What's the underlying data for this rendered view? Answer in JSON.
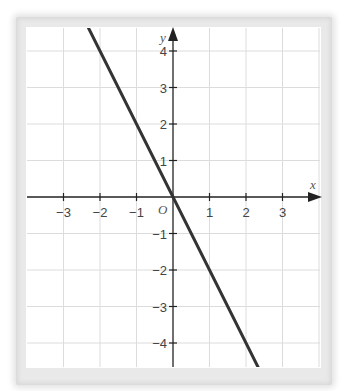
{
  "chart_data": {
    "type": "line",
    "title": "",
    "xlabel": "x",
    "ylabel": "y",
    "origin_label": "O",
    "xlim": [
      -4,
      4
    ],
    "ylim": [
      -5,
      5
    ],
    "x_ticks": [
      -3,
      -2,
      -1,
      1,
      2,
      3
    ],
    "y_ticks": [
      -4,
      -3,
      -2,
      -1,
      1,
      2,
      3,
      4
    ],
    "x_tick_labels": [
      "−3",
      "−2",
      "−1",
      "1",
      "2",
      "3"
    ],
    "y_tick_labels": [
      "−4",
      "−3",
      "−2",
      "−1",
      "1",
      "2",
      "3",
      "4"
    ],
    "grid": true,
    "series": [
      {
        "name": "y = -2x",
        "x": [
          -2.5,
          2.5
        ],
        "y": [
          5,
          -5
        ],
        "color": "#333333"
      }
    ],
    "colors": {
      "grid": "#dcdcdc",
      "axis": "#222222",
      "line": "#333333",
      "frame": "#e6e6e6"
    }
  }
}
